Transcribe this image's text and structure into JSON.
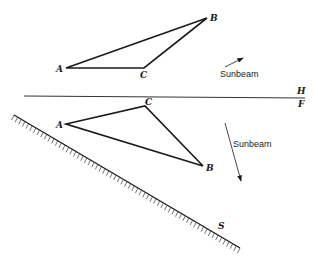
{
  "diagram": {
    "type": "descriptive-geometry shadow construction",
    "top_view": {
      "points": {
        "A": [
          66,
          68
        ],
        "B": [
          207,
          18
        ],
        "C": [
          144,
          68
        ]
      },
      "labels": {
        "A": "A",
        "B": "B",
        "C": "C"
      },
      "sunbeam_label": "Sunbeam",
      "sunbeam_arrow": {
        "from": [
          225,
          67
        ],
        "to": [
          243,
          58
        ]
      }
    },
    "reference_line": {
      "y": 97,
      "x1": 24,
      "x2": 305,
      "label_above": "H",
      "label_below": "F"
    },
    "front_view": {
      "points": {
        "A": [
          66,
          124
        ],
        "B": [
          203,
          166
        ],
        "C": [
          145,
          106
        ]
      },
      "labels": {
        "A": "A",
        "B": "B",
        "C": "C"
      },
      "sunbeam_label": "Sunbeam",
      "sunbeam_arrow": {
        "from": [
          225,
          123
        ],
        "to": [
          241,
          181
        ]
      }
    },
    "plane": {
      "label": "S",
      "from": [
        14,
        115
      ],
      "to": [
        240,
        248
      ]
    },
    "colors": {
      "line": "#1a1a1a",
      "background": "#ffffff"
    }
  }
}
